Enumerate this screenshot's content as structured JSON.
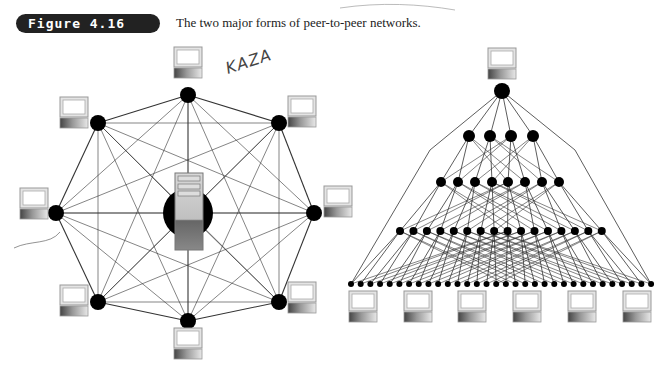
{
  "figure": {
    "label": "Figure 4.16",
    "caption": "The two major forms of peer-to-peer networks.",
    "annotation": "KAZA"
  },
  "diagrams": {
    "left": {
      "type": "fully-meshed peer network with central server",
      "center_icon": "server-icon",
      "peer_count": 8
    },
    "right": {
      "type": "hierarchical tree peer network",
      "tiers": [
        1,
        4,
        8,
        16,
        32
      ],
      "leaf_computer_count": 6
    }
  },
  "colors": {
    "node": "#000000",
    "line": "#333333",
    "badge": "#222222"
  }
}
